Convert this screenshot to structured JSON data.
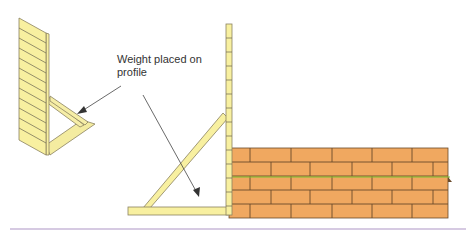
{
  "annotation": {
    "line1": "Weight placed on",
    "line2": "profile"
  },
  "colors": {
    "wood": "#f8f0a0",
    "wood_edge": "#8a8260",
    "brick": "#f0a860",
    "mortar": "#6a4a2a",
    "guide_line": "#7ac030",
    "separator": "#c8b8d8",
    "arrow": "#444444"
  }
}
